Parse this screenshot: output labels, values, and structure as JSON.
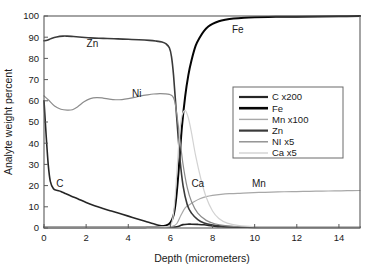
{
  "chart_data": {
    "type": "line",
    "title": "",
    "xlabel": "Depth (micrometers)",
    "ylabel": "Analyte weight percent",
    "xlim": [
      0,
      15
    ],
    "ylim": [
      0,
      100
    ],
    "xticks": [
      0,
      2,
      4,
      6,
      8,
      10,
      12,
      14
    ],
    "yticks": [
      0,
      10,
      20,
      30,
      40,
      50,
      60,
      70,
      80,
      90,
      100
    ],
    "xtick_labels": [
      "0",
      "2",
      "4",
      "6",
      "8",
      "10",
      "12",
      "14"
    ],
    "ytick_labels": [
      "0",
      "10",
      "20",
      "30",
      "40",
      "50",
      "60",
      "70",
      "80",
      "90",
      "100"
    ],
    "grid": false,
    "legend_position": "center-right",
    "legend_entries": [
      "C x200",
      "Fe",
      "Mn x100",
      "Zn",
      "NI x5",
      "Ca x5"
    ],
    "curve_annotations": [
      {
        "text": "Zn",
        "x": 2.3,
        "y": 85.5
      },
      {
        "text": "Ni",
        "x": 4.4,
        "y": 62.0
      },
      {
        "text": "Fe",
        "x": 9.2,
        "y": 92.0
      },
      {
        "text": "C",
        "x": 0.75,
        "y": 19.5
      },
      {
        "text": "Ca",
        "x": 7.3,
        "y": 19.5
      },
      {
        "text": "Mn",
        "x": 10.2,
        "y": 19.5
      }
    ],
    "series": [
      {
        "name": "C x200",
        "color": "#262626",
        "width": 1.6,
        "x": [
          0.0,
          0.1,
          0.2,
          0.3,
          0.45,
          0.6,
          0.8,
          1.0,
          1.3,
          1.6,
          2.0,
          2.4,
          2.8,
          3.2,
          3.6,
          4.0,
          4.4,
          4.8,
          5.2,
          5.5,
          5.8,
          6.1,
          6.3,
          6.45,
          6.6,
          6.8,
          7.0,
          7.3,
          7.6,
          8.0,
          8.4,
          9.0,
          10.0,
          11.0,
          12.0,
          13.0,
          14.0,
          15.0
        ],
        "y": [
          60.0,
          44.0,
          30.0,
          22.0,
          18.5,
          17.8,
          17.2,
          16.3,
          15.0,
          13.8,
          12.0,
          10.5,
          9.2,
          8.0,
          6.8,
          5.6,
          4.4,
          3.2,
          2.0,
          1.2,
          0.7,
          0.5,
          0.6,
          1.0,
          1.6,
          1.8,
          1.8,
          1.7,
          1.5,
          1.0,
          0.6,
          0.4,
          0.3,
          0.3,
          0.3,
          0.3,
          0.3,
          0.3
        ]
      },
      {
        "name": "Fe",
        "color": "#050505",
        "width": 2.0,
        "x": [
          0.0,
          1.0,
          2.0,
          3.0,
          4.0,
          4.8,
          5.4,
          5.8,
          6.0,
          6.15,
          6.25,
          6.35,
          6.45,
          6.55,
          6.7,
          6.85,
          7.0,
          7.2,
          7.4,
          7.6,
          7.8,
          8.0,
          8.3,
          8.6,
          9.0,
          9.5,
          10.0,
          11.0,
          12.0,
          13.0,
          14.0,
          15.0
        ],
        "y": [
          0.3,
          0.3,
          0.3,
          0.3,
          0.3,
          0.4,
          0.6,
          1.2,
          2.5,
          6.0,
          12.0,
          22.0,
          35.0,
          48.0,
          62.0,
          72.0,
          79.0,
          86.0,
          90.0,
          93.0,
          95.0,
          96.3,
          97.5,
          98.2,
          98.8,
          99.2,
          99.4,
          99.6,
          99.7,
          99.8,
          99.9,
          100.0
        ]
      },
      {
        "name": "Mn x100",
        "color": "#a8a8a8",
        "width": 1.2,
        "x": [
          0.0,
          1.0,
          2.0,
          3.0,
          4.0,
          5.0,
          5.8,
          6.1,
          6.3,
          6.5,
          6.7,
          6.9,
          7.1,
          7.4,
          7.7,
          8.0,
          8.4,
          8.8,
          9.2,
          9.7,
          10.2,
          10.8,
          11.4,
          12.0,
          12.6,
          13.2,
          13.8,
          14.4,
          15.0
        ],
        "y": [
          0.4,
          0.4,
          0.4,
          0.4,
          0.4,
          0.4,
          0.5,
          0.8,
          2.0,
          6.0,
          9.5,
          11.0,
          12.3,
          13.8,
          14.8,
          15.4,
          15.9,
          16.2,
          16.3,
          16.6,
          16.8,
          16.9,
          17.1,
          17.2,
          17.3,
          17.4,
          17.5,
          17.6,
          17.7
        ]
      },
      {
        "name": "Zn",
        "color": "#3a3a3a",
        "width": 1.6,
        "x": [
          0.0,
          0.15,
          0.35,
          0.6,
          0.9,
          1.1,
          1.4,
          1.8,
          2.2,
          2.6,
          3.0,
          3.5,
          4.0,
          4.5,
          5.0,
          5.3,
          5.6,
          5.8,
          5.95,
          6.05,
          6.15,
          6.3,
          6.45,
          6.6,
          6.8,
          7.0,
          7.3,
          7.6,
          8.0,
          8.4,
          9.0,
          10.0,
          11.0,
          12.0,
          13.0,
          14.0,
          15.0
        ],
        "y": [
          88.3,
          88.6,
          89.4,
          90.1,
          90.5,
          90.5,
          90.3,
          90.0,
          89.7,
          89.5,
          89.4,
          89.2,
          89.0,
          88.8,
          88.5,
          88.2,
          87.7,
          86.8,
          85.0,
          81.0,
          72.0,
          52.0,
          33.0,
          20.0,
          11.0,
          7.0,
          4.0,
          2.4,
          1.4,
          0.9,
          0.6,
          0.5,
          0.5,
          0.5,
          0.5,
          0.5,
          0.5
        ]
      },
      {
        "name": "NI x5",
        "color": "#8c8c8c",
        "width": 1.2,
        "x": [
          0.0,
          0.2,
          0.5,
          0.8,
          1.1,
          1.35,
          1.6,
          1.9,
          2.2,
          2.5,
          2.8,
          3.1,
          3.4,
          3.7,
          4.0,
          4.3,
          4.6,
          4.9,
          5.2,
          5.5,
          5.75,
          5.95,
          6.1,
          6.2,
          6.3,
          6.45,
          6.6,
          6.8,
          7.0,
          7.3,
          7.7,
          8.1,
          8.6,
          9.2,
          10.0,
          11.0,
          12.0,
          13.5,
          15.0
        ],
        "y": [
          62.3,
          60.5,
          57.5,
          56.0,
          55.6,
          55.8,
          57.2,
          59.5,
          61.0,
          61.5,
          61.3,
          60.8,
          60.5,
          60.6,
          61.0,
          61.6,
          62.3,
          62.8,
          63.2,
          63.4,
          63.3,
          63.0,
          62.2,
          60.0,
          54.0,
          42.0,
          30.0,
          19.0,
          12.5,
          7.0,
          3.6,
          2.0,
          1.1,
          0.7,
          0.5,
          0.5,
          0.5,
          0.5,
          0.5
        ]
      },
      {
        "name": "Ca x5",
        "color": "#d2d2d2",
        "width": 1.2,
        "x": [
          0.0,
          1.0,
          2.0,
          3.0,
          4.0,
          5.0,
          5.6,
          5.9,
          6.05,
          6.15,
          6.25,
          6.35,
          6.45,
          6.55,
          6.7,
          6.85,
          7.0,
          7.2,
          7.45,
          7.7,
          8.0,
          8.3,
          8.7,
          9.2,
          10.0,
          11.0,
          12.0,
          13.0,
          14.0,
          15.0
        ],
        "y": [
          0.4,
          0.4,
          0.4,
          0.4,
          0.4,
          0.4,
          0.5,
          0.8,
          2.0,
          7.0,
          18.0,
          33.0,
          46.0,
          53.0,
          55.5,
          52.0,
          45.0,
          34.0,
          23.0,
          14.5,
          8.0,
          4.5,
          2.3,
          1.2,
          0.6,
          0.5,
          0.5,
          0.5,
          0.5,
          0.5
        ]
      }
    ]
  },
  "legend": {
    "items": [
      {
        "label": "C x200",
        "color": "#262626",
        "width": 2.2
      },
      {
        "label": "Fe",
        "color": "#050505",
        "width": 2.6
      },
      {
        "label": "Mn x100",
        "color": "#a8a8a8",
        "width": 1.4
      },
      {
        "label": "Zn",
        "color": "#3a3a3a",
        "width": 2.2
      },
      {
        "label": "NI x5",
        "color": "#8c8c8c",
        "width": 1.4
      },
      {
        "label": "Ca x5",
        "color": "#d2d2d2",
        "width": 1.4
      }
    ]
  }
}
